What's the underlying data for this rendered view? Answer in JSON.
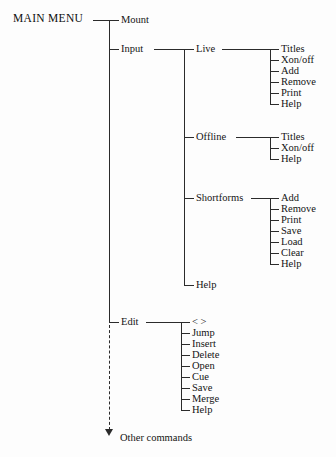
{
  "diagram": {
    "type": "tree",
    "title": "MAIN MENU",
    "root": {
      "label": "MAIN MENU"
    },
    "level1": [
      {
        "label": "Mount"
      },
      {
        "label": "Input"
      },
      {
        "label": "Edit"
      }
    ],
    "input_children": [
      {
        "label": "Live"
      },
      {
        "label": "Offline"
      },
      {
        "label": "Shortforms"
      },
      {
        "label": "Help"
      }
    ],
    "live_children": [
      {
        "label": "Titles"
      },
      {
        "label": "Xon/off"
      },
      {
        "label": "Add"
      },
      {
        "label": "Remove"
      },
      {
        "label": "Print"
      },
      {
        "label": "Help"
      }
    ],
    "offline_children": [
      {
        "label": "Titles"
      },
      {
        "label": "Xon/off"
      },
      {
        "label": "Help"
      }
    ],
    "shortforms_children": [
      {
        "label": "Add"
      },
      {
        "label": "Remove"
      },
      {
        "label": "Print"
      },
      {
        "label": "Save"
      },
      {
        "label": "Load"
      },
      {
        "label": "Clear"
      },
      {
        "label": "Help"
      }
    ],
    "edit_children": [
      {
        "label": "< >"
      },
      {
        "label": "Jump"
      },
      {
        "label": "Insert"
      },
      {
        "label": "Delete"
      },
      {
        "label": "Open"
      },
      {
        "label": "Cue"
      },
      {
        "label": "Save"
      },
      {
        "label": "Merge"
      },
      {
        "label": "Help"
      }
    ],
    "continuation": {
      "label": "Other commands"
    },
    "colors": {
      "background": "#fdfdfd",
      "line": "#2b2b2b",
      "text": "#141414"
    }
  }
}
